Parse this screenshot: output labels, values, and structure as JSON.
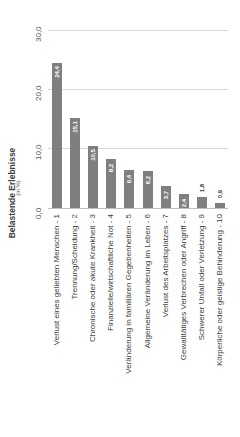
{
  "chart_data": {
    "type": "bar",
    "orientation": "vertical (figure rotated 90° counter-clockwise)",
    "title": "Belastende Erlebnisse",
    "subtitle": "(in %)",
    "xlabel": "",
    "ylabel": "",
    "ylim": [
      0,
      30
    ],
    "yticks": [
      "0,0",
      "10,0",
      "20,0",
      "30,0"
    ],
    "grid": true,
    "legend": "none",
    "categories": [
      "Verlust eines geliebten Menschen - 1",
      "Trennung/Scheidung - 2",
      "Chronische oder akute Krankheit - 3",
      "Finanzielle/wirtschaftliche Not - 4",
      "Veränderung in familiären Gegebenheiten - 5",
      "Allgemeine Veränderung im Leben - 6",
      "Verlust des Arbeitsplatzes - 7",
      "Gewalttätiges Verbrechen oder Angriff - 8",
      "Schwerer Unfall oder Verletzung - 9",
      "Körperliche oder geistige Behinderung - 10"
    ],
    "values": [
      24.4,
      15.1,
      10.5,
      8.2,
      6.4,
      6.2,
      3.7,
      2.4,
      1.8,
      0.9
    ],
    "value_labels": [
      "24,4",
      "15,1",
      "10,5",
      "8,2",
      "6,4",
      "6,2",
      "3,7",
      "2,4",
      "1,8",
      "0,9"
    ],
    "bar_color": "#7f7f7f"
  }
}
